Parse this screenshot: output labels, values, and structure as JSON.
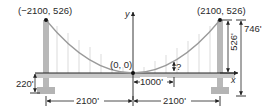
{
  "diagram": {
    "type": "suspension-bridge-parabola",
    "points": {
      "left_tower_top": "(−2100, 526)",
      "right_tower_top": "(2100, 526)",
      "origin": "(0, 0)"
    },
    "axes": {
      "x_label": "x",
      "y_label": "y"
    },
    "dimensions": {
      "cable_height": "526'",
      "tower_total_height": "746'",
      "deck_height": "220'",
      "left_span": "2100'",
      "right_span": "2100'",
      "query_distance": "1000'",
      "unknown": "?"
    },
    "colors": {
      "tower": "#b8b8b8",
      "deck": "#c4c4c4",
      "cable": "#9a9a9a",
      "line": "#222222",
      "suspender": "#d0d0d0"
    }
  }
}
